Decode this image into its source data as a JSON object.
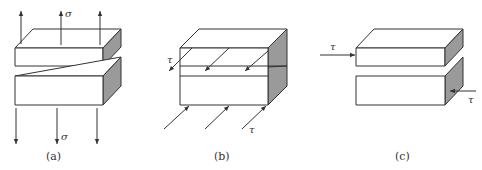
{
  "figure": {
    "panels": [
      {
        "id": "a",
        "caption": "(a)",
        "load_type": "normal tension",
        "top_symbol": "σ",
        "bottom_symbol": "σ"
      },
      {
        "id": "b",
        "caption": "(b)",
        "load_type": "in-plane shear (out of plane direction)",
        "top_symbol": "τ",
        "bottom_symbol": "τ"
      },
      {
        "id": "c",
        "caption": "(c)",
        "load_type": "in-plane shear (lateral)",
        "top_symbol": "τ",
        "bottom_symbol": "τ"
      }
    ],
    "colors": {
      "stroke": "#333333",
      "shaded_side": "#9a9a9a",
      "background": "#ffffff"
    }
  }
}
